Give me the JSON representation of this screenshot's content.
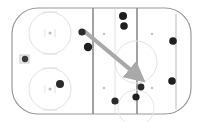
{
  "diagram": {
    "surface": {
      "label": "ice-surface",
      "fill_color": "#ffffff",
      "border_color": "#9a9a9a",
      "corner_radius": 26,
      "x": 12,
      "y": 8,
      "width": 179,
      "height": 106
    },
    "zone_lines": [
      {
        "label": "blue-line-left",
        "x": 93,
        "color": "#8c8c8c",
        "width": 1.6
      },
      {
        "label": "blue-line-right",
        "x": 137,
        "color": "#8c8c8c",
        "width": 1.6
      },
      {
        "label": "goal-line-right",
        "x": 176,
        "color": "#b4b4b4",
        "width": 0.9
      },
      {
        "label": "center-red-line",
        "x": 115,
        "color": "#d8d8d8",
        "width": 0.8
      }
    ],
    "faceoff_circles": [
      {
        "label": "faceoff-circle-upper-left",
        "cx": 50,
        "cy": 33,
        "r": 21,
        "color": "#e2e2e2"
      },
      {
        "label": "faceoff-circle-lower-left",
        "cx": 50,
        "cy": 89,
        "r": 21,
        "color": "#e2e2e2"
      },
      {
        "label": "faceoff-circle-center",
        "cx": 136,
        "cy": 62,
        "r": 21,
        "color": "#e4e4e4"
      },
      {
        "label": "faceoff-circle-lower-right",
        "cx": 136,
        "cy": 108,
        "r": 18,
        "color": "#e6e6e6"
      }
    ],
    "faceoff_dots": [
      {
        "label": "faceoff-dot-upper-left",
        "cx": 50,
        "cy": 33,
        "r": 1.5,
        "color": "#bdbdbd"
      },
      {
        "label": "faceoff-dot-lower-left",
        "cx": 50,
        "cy": 89,
        "r": 1.5,
        "color": "#bdbdbd"
      },
      {
        "label": "faceoff-dot-neutral-upper",
        "cx": 104,
        "cy": 34,
        "r": 1.3,
        "color": "#c6c6c6"
      },
      {
        "label": "faceoff-dot-neutral-lower",
        "cx": 104,
        "cy": 88,
        "r": 1.3,
        "color": "#c6c6c6"
      },
      {
        "label": "faceoff-dot-right-upper",
        "cx": 152,
        "cy": 34,
        "r": 1.3,
        "color": "#c6c6c6"
      },
      {
        "label": "faceoff-dot-right-lower",
        "cx": 152,
        "cy": 88,
        "r": 1.3,
        "color": "#c6c6c6"
      }
    ],
    "goal_crease": {
      "label": "goal-crease-left",
      "x": 20,
      "y": 55,
      "width": 9,
      "height": 8,
      "border_color": "#bcbcbc"
    },
    "goalie": {
      "label": "goalie-marker",
      "cx": 25,
      "cy": 59,
      "r": 3.2,
      "color": "#3a3a3a"
    },
    "players": [
      {
        "label": "player-left-zone",
        "cx": 60,
        "cy": 84,
        "r": 4.0,
        "color": "#2b2b2b"
      },
      {
        "label": "player-puck-carrier",
        "cx": 82,
        "cy": 32,
        "r": 3.6,
        "color": "#2b2b2b"
      },
      {
        "label": "player-support-left",
        "cx": 88,
        "cy": 47,
        "r": 4.2,
        "color": "#1f1f1f"
      },
      {
        "label": "player-neutral-top-a",
        "cx": 123,
        "cy": 16,
        "r": 4.0,
        "color": "#1f1f1f"
      },
      {
        "label": "player-neutral-top-b",
        "cx": 124,
        "cy": 26,
        "r": 3.8,
        "color": "#1f1f1f"
      },
      {
        "label": "player-right-upper",
        "cx": 173,
        "cy": 41,
        "r": 3.8,
        "color": "#1f1f1f"
      },
      {
        "label": "player-right-lower",
        "cx": 172,
        "cy": 81,
        "r": 3.8,
        "color": "#1f1f1f"
      },
      {
        "label": "player-target-a",
        "cx": 141,
        "cy": 87,
        "r": 3.4,
        "color": "#2b2b2b"
      },
      {
        "label": "player-target-b",
        "cx": 136,
        "cy": 97,
        "r": 3.6,
        "color": "#1f1f1f"
      },
      {
        "label": "player-low-slot",
        "cx": 115,
        "cy": 101,
        "r": 3.6,
        "color": "#2b2b2b"
      }
    ],
    "pass_arrow": {
      "label": "pass-arrow",
      "start_x": 84,
      "start_y": 31,
      "end_x": 139,
      "end_y": 77,
      "color": "#a9a9a9",
      "stroke_width": 4.2,
      "head_size": 7
    }
  }
}
